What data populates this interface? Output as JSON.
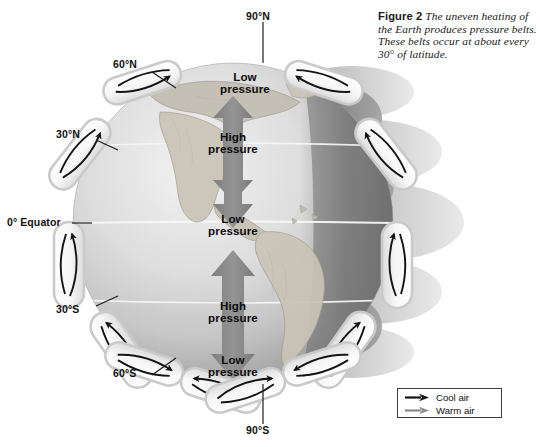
{
  "figure": {
    "label": "Figure 2",
    "caption": "The uneven heating of the Earth produces pressure belts. These belts occur at about every 30° of latitude."
  },
  "latitude_labels": [
    {
      "id": "lat-90n",
      "text": "90°N"
    },
    {
      "id": "lat-60n",
      "text": "60°N"
    },
    {
      "id": "lat-30n",
      "text": "30°N"
    },
    {
      "id": "lat-0",
      "text": "0° Equator"
    },
    {
      "id": "lat-30s",
      "text": "30°S"
    },
    {
      "id": "lat-60s",
      "text": "60°S"
    },
    {
      "id": "lat-90s",
      "text": "90°S"
    }
  ],
  "pressure_belts": [
    {
      "id": "belt-polar-n",
      "line1": "Low",
      "line2": "pressure",
      "latitude": "90°N"
    },
    {
      "id": "belt-subtrop-n",
      "line1": "High",
      "line2": "pressure",
      "latitude": "30°N"
    },
    {
      "id": "belt-equator",
      "line1": "Low",
      "line2": "pressure",
      "latitude": "0°"
    },
    {
      "id": "belt-subtrop-s",
      "line1": "High",
      "line2": "pressure",
      "latitude": "30°S"
    },
    {
      "id": "belt-polar-s",
      "line1": "Low",
      "line2": "pressure",
      "latitude": "60°S"
    }
  ],
  "legend": {
    "items": [
      {
        "id": "legend-cool-air",
        "label": "Cool air",
        "color": "#111111",
        "icon": "arrow-right-icon"
      },
      {
        "id": "legend-warm-air",
        "label": "Warm air",
        "color": "#8a8a8a",
        "icon": "arrow-right-icon"
      }
    ]
  },
  "colors": {
    "background": "#ffffff",
    "globe_light": "#e8e8e8",
    "globe_mid": "#cfcfcf",
    "globe_shadow": "#8d8d8d",
    "globe_dark": "#6e6e6e",
    "cell_fill": "#fbfbfb",
    "cell_stroke": "#c9c9c9",
    "arrow_stroke": "#141414",
    "big_arrow": "#8e8e8e",
    "land": "#bdb8ae",
    "text": "#111111"
  }
}
